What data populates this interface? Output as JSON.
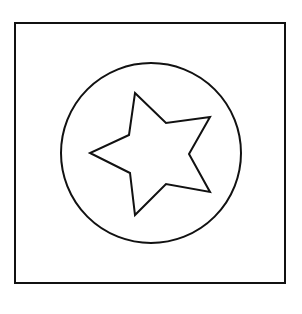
{
  "figure": {
    "shapes": [
      "square",
      "circle",
      "star"
    ],
    "star_points": 5,
    "stroke_color": "#111111",
    "fill_color": "#ffffff",
    "background_color": "#ffffff"
  }
}
